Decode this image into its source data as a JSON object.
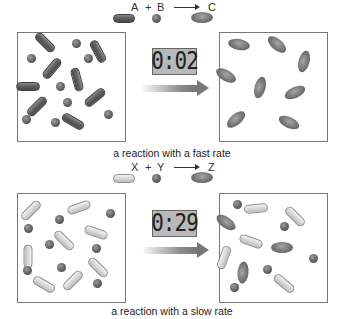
{
  "fast_panel": {
    "equation": {
      "reactant1": "A",
      "plus": "+",
      "reactant2": "B",
      "product": "C"
    },
    "timer": "0:02",
    "caption": "a reaction with a fast rate",
    "before_particles": [
      {
        "type": "rod-dark",
        "x": 45,
        "y": 42,
        "w": 24,
        "h": 9,
        "rot": 45
      },
      {
        "type": "ball-dark",
        "x": 76,
        "y": 43,
        "s": 9
      },
      {
        "type": "rod-dark",
        "x": 98,
        "y": 51,
        "w": 24,
        "h": 9,
        "rot": 62
      },
      {
        "type": "ball-dark",
        "x": 31,
        "y": 58,
        "s": 9
      },
      {
        "type": "ball-dark",
        "x": 88,
        "y": 58,
        "s": 9
      },
      {
        "type": "rod-dark",
        "x": 52,
        "y": 68,
        "w": 24,
        "h": 9,
        "rot": -50
      },
      {
        "type": "rod-dark",
        "x": 77,
        "y": 79,
        "w": 24,
        "h": 9,
        "rot": 75
      },
      {
        "type": "rod-dark",
        "x": 28,
        "y": 86,
        "w": 24,
        "h": 9,
        "rot": 0
      },
      {
        "type": "ball-dark",
        "x": 60,
        "y": 86,
        "s": 9
      },
      {
        "type": "rod-dark",
        "x": 95,
        "y": 97,
        "w": 24,
        "h": 9,
        "rot": -40
      },
      {
        "type": "rod-dark",
        "x": 37,
        "y": 106,
        "w": 24,
        "h": 9,
        "rot": -45
      },
      {
        "type": "ball-dark",
        "x": 67,
        "y": 102,
        "s": 9
      },
      {
        "type": "ball-dark",
        "x": 26,
        "y": 119,
        "s": 9
      },
      {
        "type": "ball-dark",
        "x": 55,
        "y": 122,
        "s": 9
      },
      {
        "type": "rod-dark",
        "x": 73,
        "y": 121,
        "w": 24,
        "h": 9,
        "rot": 30
      },
      {
        "type": "ball-dark",
        "x": 108,
        "y": 114,
        "s": 9
      }
    ],
    "after_particles": [
      {
        "type": "ellipse",
        "x": 239,
        "y": 44,
        "w": 22,
        "h": 11,
        "rot": 10
      },
      {
        "type": "ellipse",
        "x": 277,
        "y": 44,
        "w": 22,
        "h": 11,
        "rot": 40
      },
      {
        "type": "ellipse",
        "x": 304,
        "y": 61,
        "w": 22,
        "h": 11,
        "rot": -75
      },
      {
        "type": "ellipse",
        "x": 226,
        "y": 75,
        "w": 22,
        "h": 11,
        "rot": 30
      },
      {
        "type": "ellipse",
        "x": 260,
        "y": 87,
        "w": 22,
        "h": 11,
        "rot": -75
      },
      {
        "type": "ellipse",
        "x": 295,
        "y": 92,
        "w": 22,
        "h": 11,
        "rot": -25
      },
      {
        "type": "ellipse",
        "x": 236,
        "y": 119,
        "w": 22,
        "h": 11,
        "rot": -40
      },
      {
        "type": "ellipse",
        "x": 289,
        "y": 122,
        "w": 22,
        "h": 11,
        "rot": 25
      }
    ]
  },
  "slow_panel": {
    "equation": {
      "reactant1": "X",
      "plus": "+",
      "reactant2": "Y",
      "product": "Z"
    },
    "timer": "0:29",
    "caption": "a reaction with a slow rate",
    "before_particles": [
      {
        "type": "rod-light",
        "x": 31,
        "y": 210,
        "w": 24,
        "h": 9,
        "rot": -45
      },
      {
        "type": "rod-light",
        "x": 79,
        "y": 207,
        "w": 24,
        "h": 9,
        "rot": -20
      },
      {
        "type": "ball-dark",
        "x": 110,
        "y": 213,
        "s": 9
      },
      {
        "type": "ball-dark",
        "x": 59,
        "y": 219,
        "s": 9
      },
      {
        "type": "ball-dark",
        "x": 28,
        "y": 228,
        "s": 9
      },
      {
        "type": "rod-light",
        "x": 96,
        "y": 232,
        "w": 24,
        "h": 9,
        "rot": 20
      },
      {
        "type": "rod-light",
        "x": 64,
        "y": 240,
        "w": 24,
        "h": 9,
        "rot": 45
      },
      {
        "type": "ball-dark",
        "x": 49,
        "y": 244,
        "s": 9
      },
      {
        "type": "ball-dark",
        "x": 96,
        "y": 248,
        "s": 9
      },
      {
        "type": "rod-light",
        "x": 28,
        "y": 256,
        "w": 24,
        "h": 9,
        "rot": 90
      },
      {
        "type": "ball-dark",
        "x": 27,
        "y": 270,
        "s": 9
      },
      {
        "type": "ball-dark",
        "x": 61,
        "y": 267,
        "s": 9
      },
      {
        "type": "rod-light",
        "x": 98,
        "y": 267,
        "w": 24,
        "h": 9,
        "rot": 45
      },
      {
        "type": "rod-light",
        "x": 44,
        "y": 284,
        "w": 24,
        "h": 9,
        "rot": 30
      },
      {
        "type": "rod-light",
        "x": 73,
        "y": 280,
        "w": 24,
        "h": 9,
        "rot": -45
      },
      {
        "type": "ball-dark",
        "x": 97,
        "y": 283,
        "s": 9
      }
    ],
    "after_particles": [
      {
        "type": "ball-dark",
        "x": 237,
        "y": 204,
        "s": 9
      },
      {
        "type": "rod-light",
        "x": 256,
        "y": 208,
        "w": 24,
        "h": 9,
        "rot": -5
      },
      {
        "type": "rod-light",
        "x": 295,
        "y": 216,
        "w": 24,
        "h": 9,
        "rot": 45
      },
      {
        "type": "ellipse",
        "x": 226,
        "y": 222,
        "w": 22,
        "h": 11,
        "rot": 35
      },
      {
        "type": "ball-dark",
        "x": 284,
        "y": 226,
        "s": 9
      },
      {
        "type": "rod-light",
        "x": 251,
        "y": 241,
        "w": 24,
        "h": 9,
        "rot": 20
      },
      {
        "type": "ellipse",
        "x": 282,
        "y": 247,
        "w": 22,
        "h": 11,
        "rot": 0
      },
      {
        "type": "rod-light",
        "x": 224,
        "y": 257,
        "w": 24,
        "h": 9,
        "rot": -70
      },
      {
        "type": "ball-dark",
        "x": 313,
        "y": 258,
        "s": 9
      },
      {
        "type": "ellipse",
        "x": 243,
        "y": 272,
        "w": 22,
        "h": 11,
        "rot": -85
      },
      {
        "type": "ball-dark",
        "x": 267,
        "y": 269,
        "s": 9
      },
      {
        "type": "ball-dark",
        "x": 234,
        "y": 287,
        "s": 9
      },
      {
        "type": "rod-light",
        "x": 284,
        "y": 283,
        "w": 24,
        "h": 9,
        "rot": 40
      }
    ]
  },
  "legend_particles": {
    "fast": [
      {
        "type": "rod-dark",
        "x": 124,
        "y": 18,
        "w": 22,
        "h": 9,
        "rot": 0
      },
      {
        "type": "ball-dark",
        "x": 156,
        "y": 18,
        "s": 9
      },
      {
        "type": "ellipse",
        "x": 202,
        "y": 17,
        "w": 22,
        "h": 11,
        "rot": 0
      }
    ],
    "slow": [
      {
        "type": "rod-light",
        "x": 124,
        "y": 178,
        "w": 22,
        "h": 9,
        "rot": 0
      },
      {
        "type": "ball-dark",
        "x": 156,
        "y": 178,
        "s": 9
      },
      {
        "type": "ellipse",
        "x": 202,
        "y": 177,
        "w": 22,
        "h": 11,
        "rot": 0
      }
    ]
  },
  "colors": {
    "dark_particle": "#5c5c5c",
    "light_particle": "#d8d8d8",
    "timer_bg": "#b9b9b9",
    "box_border": "#777777",
    "arrow": "#777777"
  }
}
